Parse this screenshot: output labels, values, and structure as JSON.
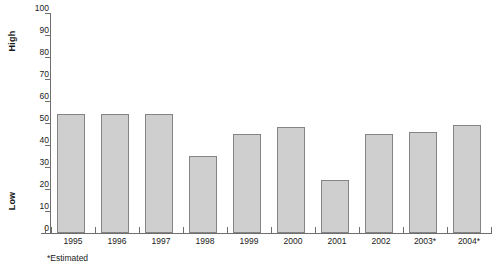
{
  "chart_data": {
    "type": "bar",
    "title": "",
    "subtitle": "",
    "xlabel": "",
    "ylabel": "",
    "categories": [
      "1995",
      "1996",
      "1997",
      "1998",
      "1999",
      "2000",
      "2001",
      "2002",
      "2003*",
      "2004*"
    ],
    "values": [
      54,
      54,
      54,
      35,
      45,
      48,
      24,
      45,
      46,
      49
    ],
    "ylim": [
      0,
      100
    ],
    "ytick_values": [
      0,
      10,
      20,
      30,
      40,
      50,
      60,
      70,
      80,
      90,
      100
    ],
    "ytick_labels": [
      "0",
      "10",
      "20",
      "30",
      "40",
      "50",
      "60",
      "70",
      "80",
      "90",
      "100"
    ],
    "grid": false,
    "legend": false,
    "legend_position": "none",
    "annotations": {
      "axis_high_label": "High",
      "axis_low_label": "Low",
      "footnote": "*Estimated"
    },
    "series": [
      {
        "name": "value",
        "values": [
          54,
          54,
          54,
          35,
          45,
          48,
          24,
          45,
          46,
          49
        ]
      }
    ]
  },
  "style": {
    "bar_fill": "#cfcfcf",
    "bar_border": "#848484",
    "axis_color": "#6e6e6e",
    "text_color": "#1a1a1a",
    "background": "#ffffff"
  }
}
